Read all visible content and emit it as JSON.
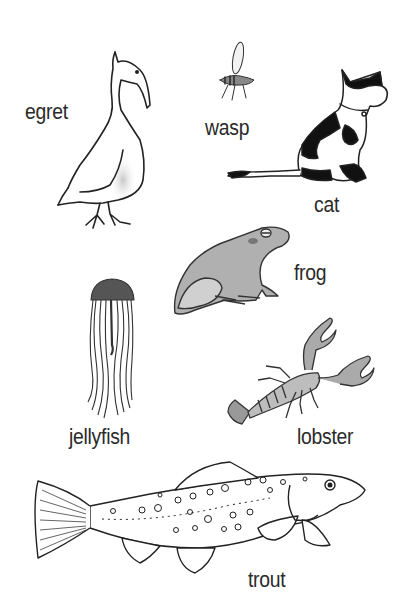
{
  "animals": [
    {
      "id": "egret",
      "label": "egret"
    },
    {
      "id": "wasp",
      "label": "wasp"
    },
    {
      "id": "cat",
      "label": "cat"
    },
    {
      "id": "frog",
      "label": "frog"
    },
    {
      "id": "jellyfish",
      "label": "jellyfish"
    },
    {
      "id": "lobster",
      "label": "lobster"
    },
    {
      "id": "trout",
      "label": "trout"
    }
  ],
  "colors": {
    "line": "#222222",
    "shade": "#9a9a9a",
    "fill_light": "#bdbdbd",
    "background": "#ffffff"
  }
}
